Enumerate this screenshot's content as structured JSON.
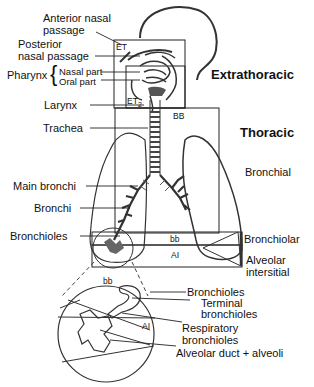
{
  "diagram": {
    "type": "anatomical respiratory tract regions",
    "region_labels": {
      "extrathoracic": "Extrathoracic",
      "thoracic": "Thoracic",
      "bronchial": "Bronchial",
      "bronchiolar": "Bronchiolar",
      "alveolar_l1": "Alveolar",
      "alveolar_l2": "intersitial"
    },
    "left_labels": {
      "anterior_l1": "Anterior nasal",
      "anterior_l2": "passage",
      "posterior_l1": "Posterior",
      "posterior_l2": "nasal passage",
      "pharynx": "Pharynx",
      "nasal_part": "Nasal part",
      "oral_part": "Oral part",
      "larynx": "Larynx",
      "trachea": "Trachea",
      "main_bronchi": "Main bronchi",
      "bronchi": "Bronchi",
      "bronchioles": "Bronchioles"
    },
    "box_tags": {
      "et1": "ET",
      "et1_sub": "1",
      "et2": "ET",
      "et2_sub": "2",
      "bb_upper": "BB",
      "bb_lower": "bb",
      "ai": "AI"
    },
    "inset": {
      "bb": "bb",
      "ai": "AI",
      "labels": {
        "bronchioles": "Bronchioles",
        "terminal_l1": "Terminal",
        "terminal_l2": "bronchioles",
        "respiratory_l1": "Respiratory",
        "respiratory_l2": "bronchioles",
        "alveolar_duct": "Alveolar duct + alveoli"
      }
    }
  }
}
